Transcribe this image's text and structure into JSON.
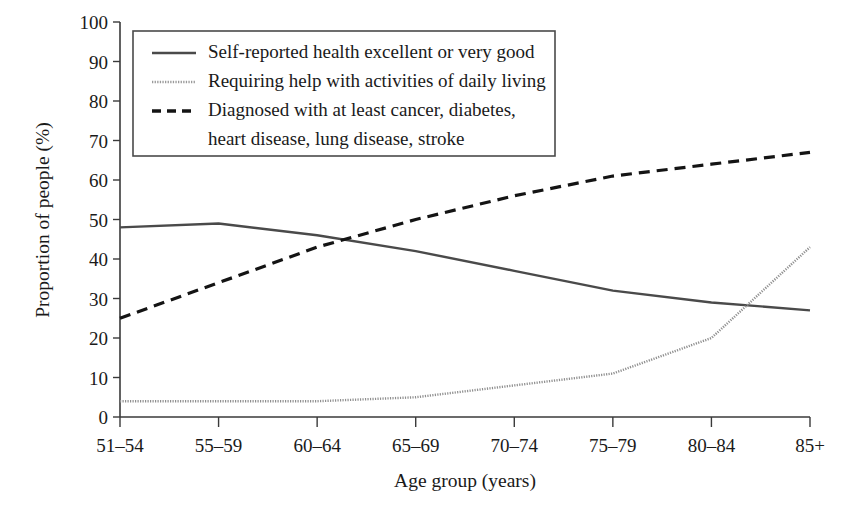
{
  "chart_data": {
    "type": "line",
    "title": "",
    "xlabel": "Age group (years)",
    "ylabel": "Proportion of people (%)",
    "categories": [
      "51–54",
      "55–59",
      "60–64",
      "65–69",
      "70–74",
      "75–79",
      "80–84",
      "85+"
    ],
    "ylim": [
      0,
      100
    ],
    "yticks": [
      "0",
      "10",
      "20",
      "30",
      "40",
      "50",
      "60",
      "70",
      "80",
      "90",
      "100"
    ],
    "ytick_values": [
      0,
      10,
      20,
      30,
      40,
      50,
      60,
      70,
      80,
      90,
      100
    ],
    "grid": false,
    "legend_position": "upper-left-inside",
    "series": [
      {
        "name": "Self-reported health excellent or very good",
        "style": "solid",
        "color": "#4a4a4a",
        "values": [
          48,
          49,
          46,
          42,
          37,
          32,
          29,
          27
        ]
      },
      {
        "name": "Requiring help with activities of daily living",
        "style": "dotted",
        "color": "#8f8f8f",
        "values": [
          4,
          4,
          4,
          5,
          8,
          11,
          20,
          43
        ]
      },
      {
        "name": "Diagnosed with at least cancer, diabetes, heart disease, lung disease, stroke",
        "style": "dashed",
        "color": "#141414",
        "values": [
          25,
          34,
          43,
          50,
          56,
          61,
          64,
          67
        ]
      }
    ]
  },
  "legend": {
    "entries": [
      {
        "line1": "Self-reported health excellent or very good",
        "line2": ""
      },
      {
        "line1": "Requiring help with activities of daily living",
        "line2": ""
      },
      {
        "line1": "Diagnosed with at least cancer, diabetes,",
        "line2": "heart disease, lung disease, stroke"
      }
    ]
  }
}
